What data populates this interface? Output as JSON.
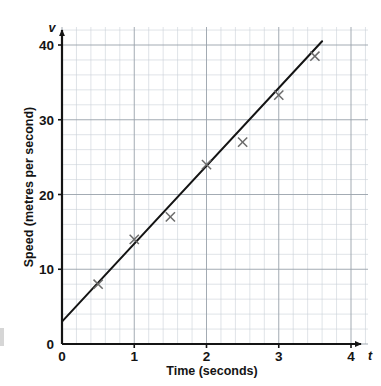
{
  "chart_data": {
    "type": "scatter",
    "title": "",
    "xlabel": "Time (seconds)",
    "ylabel": "Speed (metres per second)",
    "x_axis_symbol": "t",
    "y_axis_symbol": "v",
    "xlim": [
      0,
      4
    ],
    "ylim": [
      0,
      41
    ],
    "xticks": [
      "0",
      "1",
      "2",
      "3",
      "4"
    ],
    "xtick_values": [
      0,
      1,
      2,
      3,
      4
    ],
    "yticks": [
      "0",
      "10",
      "20",
      "30",
      "40"
    ],
    "ytick_values": [
      0,
      10,
      20,
      30,
      40
    ],
    "grid": "major and minor grid shown, minor spacing 0.2 s by 2 m/s",
    "minor_grid_x_step": 0.2,
    "minor_grid_y_step": 2,
    "major_grid_x_step": 1,
    "major_grid_y_step": 10,
    "legend": "none",
    "marker": "cross",
    "points": [
      {
        "x": 0.5,
        "y": 8
      },
      {
        "x": 1.0,
        "y": 14
      },
      {
        "x": 1.5,
        "y": 17
      },
      {
        "x": 2.0,
        "y": 24
      },
      {
        "x": 2.5,
        "y": 27
      },
      {
        "x": 3.0,
        "y": 33.3
      },
      {
        "x": 3.5,
        "y": 38.5
      }
    ],
    "series": [
      {
        "name": "Measured speed",
        "type": "scatter",
        "x": [
          0.5,
          1.0,
          1.5,
          2.0,
          2.5,
          3.0,
          3.5
        ],
        "values": [
          8,
          14,
          17,
          24,
          27,
          33.3,
          38.5
        ]
      },
      {
        "name": "Line of best fit",
        "type": "line",
        "x": [
          0,
          3.6
        ],
        "values": [
          3,
          40.5
        ],
        "intercept": 3,
        "gradient": 10.4
      }
    ],
    "colors": {
      "axis": "#141414",
      "line": "#141414",
      "marker": "#6b6b6b",
      "major_grid": "#9aa3ab",
      "minor_grid": "#c8cfd6",
      "background": "#ffffff"
    }
  }
}
